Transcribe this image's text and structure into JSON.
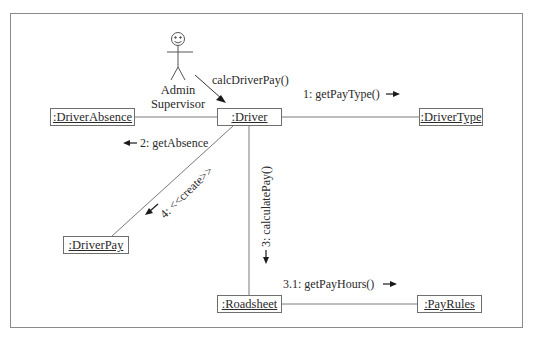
{
  "diagram": {
    "type": "UML collaboration diagram",
    "actor": {
      "name_line1": "Admin",
      "name_line2": "Supervisor"
    },
    "objects": {
      "driver": ":Driver",
      "driver_absence": ":DriverAbsence",
      "driver_type": ":DriverType",
      "driver_pay": ":DriverPay",
      "roadsheet": ":Roadsheet",
      "pay_rules": ":PayRules"
    },
    "messages": {
      "calc_driver_pay": "calcDriverPay()",
      "get_pay_type": "1: getPayType()",
      "get_absence": "2: getAbsence",
      "calculate_pay": "3: calculatePay()",
      "get_pay_hours": "3.1: getPayHours()",
      "create": "4: <<create>>"
    },
    "links": [
      {
        "from": "Admin Supervisor",
        "to": ":Driver",
        "message": "calcDriverPay()"
      },
      {
        "from": ":Driver",
        "to": ":DriverType",
        "message": "1: getPayType()"
      },
      {
        "from": ":Driver",
        "to": ":DriverAbsence",
        "message": "2: getAbsence"
      },
      {
        "from": ":Driver",
        "to": ":Roadsheet",
        "message": "3: calculatePay()"
      },
      {
        "from": ":Roadsheet",
        "to": ":PayRules",
        "message": "3.1: getPayHours()"
      },
      {
        "from": ":Driver",
        "to": ":DriverPay",
        "message": "4: <<create>>"
      }
    ],
    "colors": {
      "line": "#7a7a7a",
      "text": "#2a2a2a",
      "arrow": "#1a1a1a"
    }
  }
}
